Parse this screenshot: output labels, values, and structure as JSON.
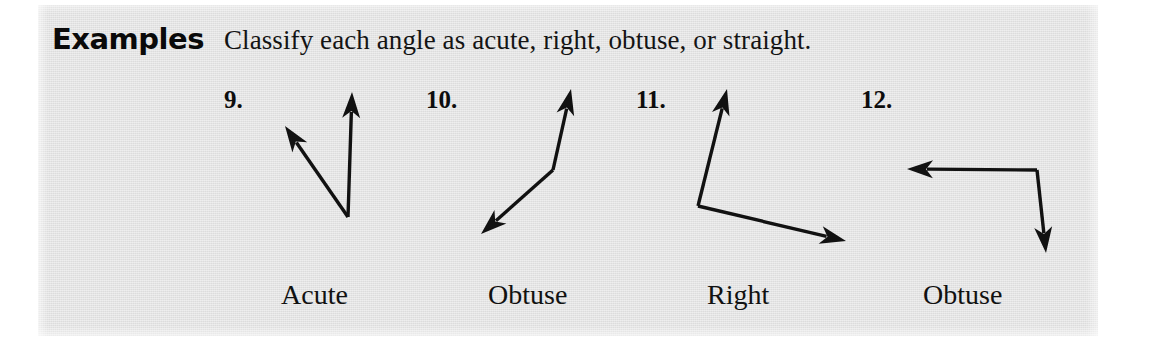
{
  "panel": {
    "background_color": "#e2e2e2",
    "page_background": "#ffffff",
    "ink_color": "#111111"
  },
  "heading": {
    "label": "Examples",
    "instruction": "Classify each angle as acute, right, obtuse, or straight."
  },
  "problems": [
    {
      "number": "9.",
      "answer": "Acute",
      "angle_type": "acute",
      "vertex": [
        348,
        217
      ],
      "rays": [
        {
          "name": "ray-up-left",
          "tip": [
            285,
            126
          ]
        },
        {
          "name": "ray-up",
          "tip": [
            352,
            92
          ]
        }
      ]
    },
    {
      "number": "10.",
      "answer": "Obtuse",
      "angle_type": "obtuse",
      "vertex": [
        553,
        170
      ],
      "rays": [
        {
          "name": "ray-up-right",
          "tip": [
            571,
            89
          ]
        },
        {
          "name": "ray-down-left",
          "tip": [
            481,
            234
          ]
        }
      ]
    },
    {
      "number": "11.",
      "answer": "Right",
      "angle_type": "right",
      "vertex": [
        698,
        206
      ],
      "rays": [
        {
          "name": "ray-up",
          "tip": [
            727,
            89
          ]
        },
        {
          "name": "ray-down-right",
          "tip": [
            846,
            241
          ]
        }
      ]
    },
    {
      "number": "12.",
      "answer": "Obtuse",
      "angle_type": "obtuse",
      "vertex": [
        1037,
        170
      ],
      "rays": [
        {
          "name": "ray-left",
          "tip": [
            907,
            169
          ]
        },
        {
          "name": "ray-down",
          "tip": [
            1046,
            253
          ]
        }
      ]
    }
  ]
}
